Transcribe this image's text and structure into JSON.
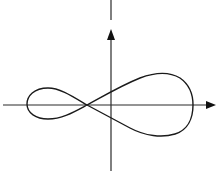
{
  "diagram": {
    "type": "curve-plot",
    "colors": {
      "background": "#ffffff",
      "axis": "#2a2a2a",
      "curve": "#1a1a1a"
    },
    "axes": {
      "x_axis": {
        "arrow": "right",
        "labels": []
      },
      "y_axis": {
        "arrow": "up",
        "labels": []
      }
    },
    "curve": {
      "self_intersection": "on negative x-axis, left of origin",
      "left_loop": "small lobe in negative x region",
      "right_loop": "large lobe extending into positive x region"
    }
  }
}
